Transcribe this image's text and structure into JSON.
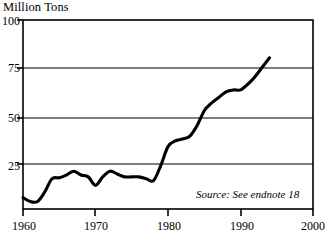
{
  "chart_data": {
    "type": "line",
    "title": "Million Tons",
    "xlabel": "",
    "ylabel": "Million Tons",
    "xlim": [
      1960,
      2000
    ],
    "ylim": [
      0,
      100
    ],
    "yticks": [
      25,
      50,
      75,
      100
    ],
    "ytick_labels": [
      "25",
      "50",
      "75",
      "100"
    ],
    "xticks": [
      1960,
      1970,
      1980,
      1990,
      2000
    ],
    "xtick_labels": [
      "1960",
      "1970",
      "1980",
      "1990",
      "2000"
    ],
    "grid": "horizontal",
    "legend": "none",
    "annotation": "Source: See endnote 18",
    "line_color": "#000000",
    "line_width_px": 3,
    "frame_color": "#000000",
    "grid_color": "#000000",
    "background": "#ffffff",
    "x": [
      1960,
      1961,
      1962,
      1963,
      1964,
      1965,
      1966,
      1967,
      1968,
      1969,
      1970,
      1971,
      1972,
      1973,
      1974,
      1975,
      1976,
      1977,
      1978,
      1979,
      1980,
      1981,
      1982,
      1983,
      1984,
      1985,
      1986,
      1987,
      1988,
      1989,
      1990,
      1991,
      1992,
      1993,
      1994
    ],
    "values": [
      6,
      4,
      4,
      9,
      16,
      16.5,
      18,
      20,
      18,
      17,
      12.5,
      17,
      20,
      18.5,
      17,
      17,
      17,
      16,
      15,
      23,
      33,
      36,
      37,
      38.5,
      44,
      52,
      56,
      59,
      62,
      63,
      63,
      66,
      70,
      75,
      80
    ],
    "series": [
      {
        "name": "Million Tons",
        "values": [
          6,
          4,
          4,
          9,
          16,
          16.5,
          18,
          20,
          18,
          17,
          12.5,
          17,
          20,
          18.5,
          17,
          17,
          17,
          16,
          15,
          23,
          33,
          36,
          37,
          38.5,
          44,
          52,
          56,
          59,
          62,
          63,
          63,
          66,
          70,
          75,
          80
        ]
      }
    ]
  },
  "figure": {
    "title": "Million Tons",
    "source_note": "Source: See endnote 18",
    "y_labels": [
      "100",
      "75",
      "50",
      "25"
    ],
    "x_labels": [
      "1960",
      "1970",
      "1980",
      "1990",
      "2000"
    ]
  }
}
